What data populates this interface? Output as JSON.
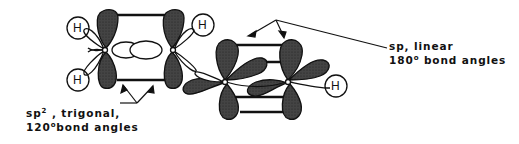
{
  "diagram": {
    "atom_label": "H",
    "labels": {
      "sp2": {
        "line1_prefix": "sp",
        "line1_sup": "2",
        "line1_suffix": " , trigonal,",
        "line2_num": "120",
        "line2_sup": "o",
        "line2_suffix": "bond  angles"
      },
      "sp": {
        "line1": "sp, linear",
        "line2_num": "180",
        "line2_sup": "o",
        "line2_suffix": " bond angles"
      }
    },
    "colors": {
      "lobe_fill": "#3a3a3a",
      "outline": "#111111",
      "background": "#ffffff"
    }
  }
}
